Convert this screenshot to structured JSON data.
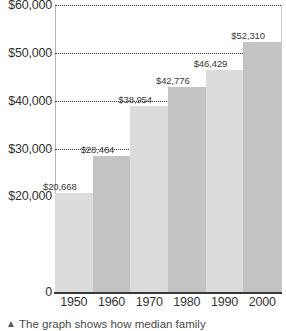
{
  "chart_data": {
    "type": "bar",
    "title": "",
    "xlabel": "",
    "ylabel": "",
    "categories": [
      "1950",
      "1960",
      "1970",
      "1980",
      "1990",
      "2000"
    ],
    "values": [
      20668,
      28464,
      38954,
      42776,
      46429,
      52310
    ],
    "value_labels": [
      "$20,668",
      "$28,464",
      "$38,954",
      "$42,776",
      "$46,429",
      "$52,310"
    ],
    "ylim": [
      0,
      60000
    ],
    "ytick_labels": [
      "$60,000",
      "$50,000",
      "$40,000",
      "$30,000",
      "$20,000",
      "0"
    ],
    "ytick_values": [
      60000,
      50000,
      40000,
      30000,
      20000,
      0
    ],
    "grid": true,
    "grid_axis": "y",
    "legend": "none",
    "bar_colors": [
      "#dcdcdc",
      "#c3c3c3",
      "#dcdcdc",
      "#c3c3c3",
      "#dcdcdc",
      "#c3c3c3"
    ],
    "bar_gap": 0
  },
  "caption": {
    "bullet": "triangle-up-icon",
    "text": "The graph shows how median family"
  },
  "colors": {
    "background": "#ffffff",
    "axis_line": "#3a3a3a",
    "gridline": "#3b3b3b",
    "label_text": "#333333",
    "bar_light": "#dcdcdc",
    "bar_dark": "#c3c3c3"
  }
}
